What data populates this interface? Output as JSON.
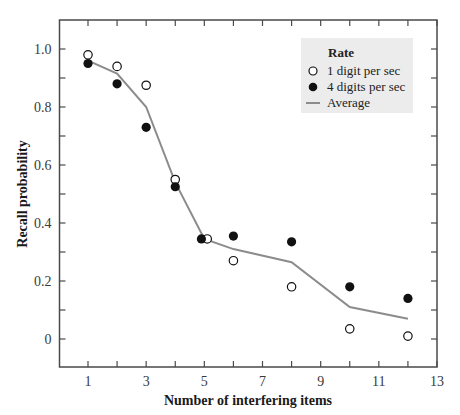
{
  "chart_data": {
    "type": "scatter",
    "title": "",
    "xlabel": "Number of interfering items",
    "ylabel": "Recall probability",
    "xlim": [
      0.0,
      13
    ],
    "ylim": [
      -0.1,
      1.1
    ],
    "x_ticks": [
      1,
      3,
      5,
      7,
      9,
      11,
      13
    ],
    "x_minor_ticks": [
      1,
      2,
      3,
      4,
      5,
      6,
      7,
      8,
      9,
      10,
      11,
      12,
      13
    ],
    "y_ticks": [
      0,
      0.2,
      0.4,
      0.6,
      0.8,
      1.0
    ],
    "y_tick_labels": [
      "0",
      "0.2",
      "0.4",
      "0.6",
      "0.8",
      "1.0"
    ],
    "y_minor_ticks": [
      0,
      0.1,
      0.2,
      0.3,
      0.4,
      0.5,
      0.6,
      0.7,
      0.8,
      0.9,
      1.0
    ],
    "grid": false,
    "legend_position": "upper right",
    "legend_title": "Rate",
    "series": [
      {
        "name": "1 digit per sec",
        "marker": "open-circle",
        "x": [
          1,
          2,
          3,
          4,
          5.1,
          6,
          8,
          10,
          12
        ],
        "y": [
          0.98,
          0.94,
          0.875,
          0.55,
          0.345,
          0.27,
          0.18,
          0.035,
          0.01
        ]
      },
      {
        "name": "4 digits per sec",
        "marker": "filled-circle",
        "x": [
          1,
          2,
          3,
          4,
          4.9,
          6,
          8,
          10,
          12
        ],
        "y": [
          0.95,
          0.88,
          0.73,
          0.525,
          0.345,
          0.355,
          0.335,
          0.18,
          0.14
        ]
      },
      {
        "name": "Average",
        "marker": "line",
        "x": [
          1,
          2,
          3,
          4,
          5,
          6,
          8,
          10,
          12
        ],
        "y": [
          0.96,
          0.915,
          0.8,
          0.54,
          0.345,
          0.31,
          0.265,
          0.11,
          0.07
        ]
      }
    ],
    "colors": {
      "frame": "#4a4a4a",
      "average_line": "#8c8c8c",
      "marker": "#111111",
      "legend_bg": "#ececec"
    }
  }
}
